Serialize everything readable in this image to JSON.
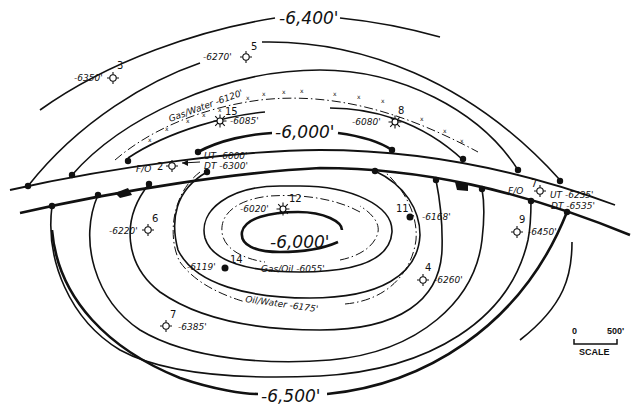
{
  "map": {
    "type": "structure-contour-map",
    "contour_labels": {
      "c6400": "-6,400'",
      "c6000_top": "-6,000'",
      "c6000_center": "-6,000'",
      "c6500": "-6,500'"
    },
    "contacts": {
      "gas_water": "Gas/Water -6120'",
      "gas_oil": "Gas/Oil -6055'",
      "oil_water": "Oil/Water -6175'"
    },
    "fault": {
      "west": {
        "label": "F/O",
        "ut": "UT -6000'",
        "dt": "DT -6300'"
      },
      "east": {
        "label": "F/O",
        "ut": "UT -6235'",
        "dt": "DT -6535'"
      }
    },
    "wells": [
      {
        "id": "3",
        "depth": "-6350'",
        "symbol": "dry-hole"
      },
      {
        "id": "5",
        "depth": "-6270'",
        "symbol": "dry-hole"
      },
      {
        "id": "15",
        "depth": "-6085'",
        "symbol": "gas-well"
      },
      {
        "id": "8",
        "depth": "-6080'",
        "symbol": "gas-well"
      },
      {
        "id": "2",
        "depth": "",
        "symbol": "dry-hole"
      },
      {
        "id": "12",
        "depth": "-6020'",
        "symbol": "gas-well"
      },
      {
        "id": "11",
        "depth": "-6168'",
        "symbol": "oil-well"
      },
      {
        "id": "6",
        "depth": "-6220'",
        "symbol": "dry-hole"
      },
      {
        "id": "14",
        "depth": "-6119'",
        "symbol": "oil-well"
      },
      {
        "id": "4",
        "depth": "-6260'",
        "symbol": "dry-hole"
      },
      {
        "id": "9",
        "depth": "-6450'",
        "symbol": "dry-hole"
      },
      {
        "id": "7",
        "depth": "",
        "symbol": "dry-hole"
      },
      {
        "id": "7",
        "depth": "-6385'",
        "symbol": "dry-hole"
      }
    ],
    "scale": {
      "start": "0",
      "end": "500'",
      "label": "SCALE"
    }
  }
}
